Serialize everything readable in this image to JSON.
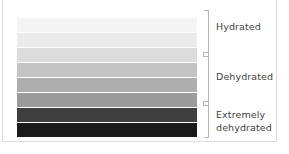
{
  "chart_data": {
    "type": "bar",
    "title": "",
    "xlabel": "",
    "ylabel": "",
    "orientation": "vertical-stack",
    "categories": [
      "1",
      "2",
      "3",
      "4",
      "5",
      "6",
      "7",
      "8"
    ],
    "values": [
      1,
      2,
      3,
      4,
      5,
      6,
      7,
      8
    ],
    "colors": [
      "#f4f4f4",
      "#ebebeb",
      "#dcdcdc",
      "#c4c4c4",
      "#aeaeae",
      "#9b9b9b",
      "#3f3f3f",
      "#1a1a1a"
    ],
    "grid": false,
    "legend_position": "right",
    "zones": [
      {
        "label": "Hydrated",
        "bands": [
          1,
          2,
          3
        ],
        "start_pct": 0,
        "end_pct": 35
      },
      {
        "label": "Dehydrated",
        "bands": [
          4,
          5,
          6
        ],
        "start_pct": 35,
        "end_pct": 73
      },
      {
        "label": "Extremely\ndehydrated",
        "bands": [
          7,
          8
        ],
        "start_pct": 73,
        "end_pct": 100
      }
    ]
  },
  "scale": {
    "bands": [
      {
        "name": "band-1",
        "color": "#f4f4f4"
      },
      {
        "name": "band-2",
        "color": "#ebebeb"
      },
      {
        "name": "band-3",
        "color": "#dcdcdc"
      },
      {
        "name": "band-4",
        "color": "#c4c4c4"
      },
      {
        "name": "band-5",
        "color": "#aeaeae"
      },
      {
        "name": "band-6",
        "color": "#9b9b9b"
      },
      {
        "name": "band-7",
        "color": "#3f3f3f"
      },
      {
        "name": "band-8",
        "color": "#1a1a1a"
      }
    ]
  },
  "axis": {
    "line_color": "#b4b4b4",
    "zones": [
      {
        "label": "Hydrated",
        "top_pct": 0,
        "height_pct": 35,
        "label_top_px": 20
      },
      {
        "label": "Dehydrated",
        "top_pct": 35,
        "height_pct": 38,
        "label_top_px": 70
      },
      {
        "label": "Extremely\ndehydrated",
        "top_pct": 73,
        "height_pct": 27,
        "label_top_px": 108
      }
    ],
    "tick_positions_pct": [
      35,
      73
    ]
  }
}
